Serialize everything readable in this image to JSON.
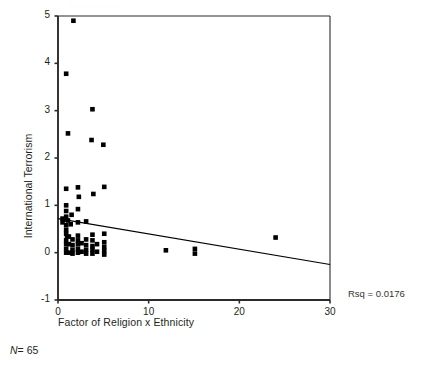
{
  "figure": {
    "ghost_top_text": "............",
    "rsq_text": "Rsq = 0.0176",
    "n_prefix": "N",
    "n_value": "= 65"
  },
  "chart_data": {
    "type": "scatter",
    "title": "",
    "xlabel": "Factor of Religion x Ethnicity",
    "ylabel": "International Terrorism",
    "xlim": [
      0,
      30
    ],
    "ylim": [
      -1,
      5
    ],
    "xticks": [
      0,
      10,
      20,
      30
    ],
    "xtick_labels": [
      "0",
      "10",
      "20",
      "30"
    ],
    "yticks": [
      -1,
      0,
      1,
      2,
      3,
      4,
      5
    ],
    "ytick_labels": [
      "-1",
      "0",
      "1",
      "2",
      "3",
      "4",
      "5"
    ],
    "grid": false,
    "legend": null,
    "marker": "square",
    "marker_color": "#000000",
    "n": 65,
    "rsq": 0.0176,
    "annotations": [
      {
        "text": "Rsq = 0.0176",
        "position": "right-of-axes"
      },
      {
        "text": "N = 65",
        "position": "below-xlabel"
      }
    ],
    "fit_line": {
      "type": "linear",
      "x": [
        0,
        30
      ],
      "y": [
        0.72,
        -0.25
      ],
      "color": "#000000"
    },
    "points": [
      {
        "x": 1.7,
        "y": 4.9
      },
      {
        "x": 0.9,
        "y": 3.78
      },
      {
        "x": 3.8,
        "y": 3.03
      },
      {
        "x": 1.1,
        "y": 2.52
      },
      {
        "x": 3.7,
        "y": 2.38
      },
      {
        "x": 5.0,
        "y": 2.28
      },
      {
        "x": 0.9,
        "y": 1.35
      },
      {
        "x": 2.2,
        "y": 1.38
      },
      {
        "x": 5.1,
        "y": 1.39
      },
      {
        "x": 2.3,
        "y": 1.18
      },
      {
        "x": 3.9,
        "y": 1.24
      },
      {
        "x": 0.9,
        "y": 1.0
      },
      {
        "x": 2.2,
        "y": 0.92
      },
      {
        "x": 0.9,
        "y": 0.88
      },
      {
        "x": 1.5,
        "y": 0.8
      },
      {
        "x": 0.9,
        "y": 0.76
      },
      {
        "x": 0.7,
        "y": 0.7
      },
      {
        "x": 1.1,
        "y": 0.68
      },
      {
        "x": 2.2,
        "y": 0.64
      },
      {
        "x": 3.1,
        "y": 0.66
      },
      {
        "x": 0.9,
        "y": 0.58
      },
      {
        "x": 1.4,
        "y": 0.6
      },
      {
        "x": 0.9,
        "y": 0.48
      },
      {
        "x": 0.9,
        "y": 0.4
      },
      {
        "x": 1.0,
        "y": 0.34
      },
      {
        "x": 2.2,
        "y": 0.36
      },
      {
        "x": 3.8,
        "y": 0.38
      },
      {
        "x": 5.1,
        "y": 0.4
      },
      {
        "x": 0.9,
        "y": 0.26
      },
      {
        "x": 1.6,
        "y": 0.28
      },
      {
        "x": 2.2,
        "y": 0.26
      },
      {
        "x": 3.1,
        "y": 0.28
      },
      {
        "x": 3.8,
        "y": 0.26
      },
      {
        "x": 5.1,
        "y": 0.22
      },
      {
        "x": 0.9,
        "y": 0.18
      },
      {
        "x": 1.6,
        "y": 0.16
      },
      {
        "x": 2.2,
        "y": 0.18
      },
      {
        "x": 3.1,
        "y": 0.16
      },
      {
        "x": 3.8,
        "y": 0.14
      },
      {
        "x": 5.1,
        "y": 0.12
      },
      {
        "x": 0.9,
        "y": 0.08
      },
      {
        "x": 1.6,
        "y": 0.06
      },
      {
        "x": 2.2,
        "y": 0.08
      },
      {
        "x": 3.1,
        "y": 0.06
      },
      {
        "x": 3.8,
        "y": 0.06
      },
      {
        "x": 5.1,
        "y": 0.04
      },
      {
        "x": 0.9,
        "y": 0.0
      },
      {
        "x": 1.6,
        "y": -0.02
      },
      {
        "x": 2.2,
        "y": 0.0
      },
      {
        "x": 3.1,
        "y": -0.02
      },
      {
        "x": 3.8,
        "y": -0.02
      },
      {
        "x": 5.1,
        "y": -0.04
      },
      {
        "x": 1.2,
        "y": 0.0
      },
      {
        "x": 2.6,
        "y": 0.02
      },
      {
        "x": 4.3,
        "y": 0.02
      },
      {
        "x": 1.2,
        "y": 0.18
      },
      {
        "x": 2.6,
        "y": 0.2
      },
      {
        "x": 4.3,
        "y": 0.18
      },
      {
        "x": 1.2,
        "y": 0.34
      },
      {
        "x": 11.9,
        "y": 0.05
      },
      {
        "x": 15.1,
        "y": 0.08
      },
      {
        "x": 15.1,
        "y": -0.02
      },
      {
        "x": 24.0,
        "y": 0.32
      },
      {
        "x": 0.5,
        "y": 0.64
      },
      {
        "x": 0.5,
        "y": 0.72
      }
    ]
  }
}
